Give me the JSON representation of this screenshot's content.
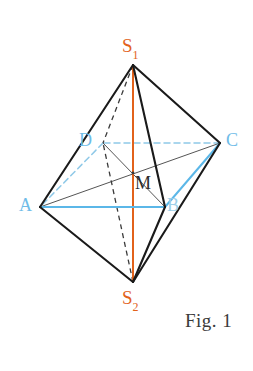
{
  "figure": {
    "caption": "Fig. 1",
    "background_color": "#ffffff",
    "width": 253,
    "height": 371,
    "shape_name": "quadrilateral bipyramid (octahedron)"
  },
  "colors": {
    "axis_orange": "#e2621b",
    "base_blue": "#5bb7e8",
    "base_blue_faint": "#9ccfe9",
    "edge_black": "#1a1a1a",
    "diagonal_gray": "#555555",
    "hidden_dash": "#3a3a3a",
    "label_dark": "#2b2b2b",
    "caption_gray": "#3a3a3a"
  },
  "vertices": [
    {
      "id": "S1",
      "label": "S",
      "subscript": "1",
      "x": 133,
      "y": 65,
      "label_x": 122,
      "label_y": 36,
      "color": "#e2621b",
      "role": "top-apex"
    },
    {
      "id": "S2",
      "label": "S",
      "subscript": "2",
      "x": 133,
      "y": 282,
      "label_x": 122,
      "label_y": 288,
      "color": "#e2621b",
      "role": "bottom-apex"
    },
    {
      "id": "A",
      "label": "A",
      "subscript": "",
      "x": 40,
      "y": 207,
      "label_x": 19,
      "label_y": 196,
      "color": "#5bb7e8",
      "role": "base-vertex"
    },
    {
      "id": "B",
      "label": "B",
      "subscript": "",
      "x": 165,
      "y": 207,
      "label_x": 167,
      "label_y": 196,
      "color": "#9ccfe9",
      "role": "base-vertex"
    },
    {
      "id": "C",
      "label": "C",
      "subscript": "",
      "x": 220,
      "y": 143,
      "label_x": 226,
      "label_y": 131,
      "color": "#5bb7e8",
      "role": "base-vertex"
    },
    {
      "id": "D",
      "label": "D",
      "subscript": "",
      "x": 103,
      "y": 143,
      "label_x": 79,
      "label_y": 131,
      "color": "#6fbce8",
      "role": "base-vertex"
    },
    {
      "id": "M",
      "label": "M",
      "subscript": "",
      "x": 133,
      "y": 173,
      "label_x": 135,
      "label_y": 174,
      "color": "#2b2b2b",
      "role": "base-center"
    }
  ],
  "edges": [
    {
      "name": "S1-A",
      "from": "S1",
      "to": "A",
      "style": "solid",
      "color": "#1a1a1a",
      "width": 2.1,
      "hidden": false
    },
    {
      "name": "S1-B",
      "from": "S1",
      "to": "B",
      "style": "solid",
      "color": "#1a1a1a",
      "width": 2.1,
      "hidden": false
    },
    {
      "name": "S1-C",
      "from": "S1",
      "to": "C",
      "style": "solid",
      "color": "#1a1a1a",
      "width": 2.1,
      "hidden": false
    },
    {
      "name": "S1-D",
      "from": "S1",
      "to": "D",
      "style": "dashed",
      "color": "#3a3a3a",
      "width": 1.3,
      "hidden": true
    },
    {
      "name": "S2-A",
      "from": "S2",
      "to": "A",
      "style": "solid",
      "color": "#1a1a1a",
      "width": 2.1,
      "hidden": false
    },
    {
      "name": "S2-B",
      "from": "S2",
      "to": "B",
      "style": "solid",
      "color": "#1a1a1a",
      "width": 2.1,
      "hidden": false
    },
    {
      "name": "S2-C",
      "from": "S2",
      "to": "C",
      "style": "solid",
      "color": "#1a1a1a",
      "width": 2.1,
      "hidden": false
    },
    {
      "name": "S2-D",
      "from": "S2",
      "to": "D",
      "style": "dashed",
      "color": "#3a3a3a",
      "width": 1.3,
      "hidden": true
    },
    {
      "name": "A-B",
      "from": "A",
      "to": "B",
      "style": "solid",
      "color": "#5bb7e8",
      "width": 2.0,
      "hidden": false
    },
    {
      "name": "B-C",
      "from": "B",
      "to": "C",
      "style": "solid",
      "color": "#5bb7e8",
      "width": 2.0,
      "hidden": false
    },
    {
      "name": "C-D",
      "from": "C",
      "to": "D",
      "style": "dashed",
      "color": "#8fc9e8",
      "width": 1.5,
      "hidden": true
    },
    {
      "name": "D-A",
      "from": "D",
      "to": "A",
      "style": "dashed",
      "color": "#8fc9e8",
      "width": 1.5,
      "hidden": true
    },
    {
      "name": "A-C",
      "from": "A",
      "to": "C",
      "style": "solid",
      "color": "#555555",
      "width": 1.0,
      "hidden": false
    },
    {
      "name": "B-D",
      "from": "B",
      "to": "D",
      "style": "solid",
      "color": "#555555",
      "width": 1.0,
      "hidden": false
    },
    {
      "name": "S1-S2",
      "from": "S1",
      "to": "S2",
      "style": "solid",
      "color": "#e2621b",
      "width": 2.0,
      "hidden": false
    }
  ],
  "axis": {
    "name": "S1-S2 vertical axis",
    "color": "#e2621b",
    "top": {
      "x": 133,
      "y": 65
    },
    "bottom": {
      "x": 133,
      "y": 282
    }
  },
  "caption": {
    "text": "Fig. 1",
    "x": 185,
    "y": 310
  }
}
